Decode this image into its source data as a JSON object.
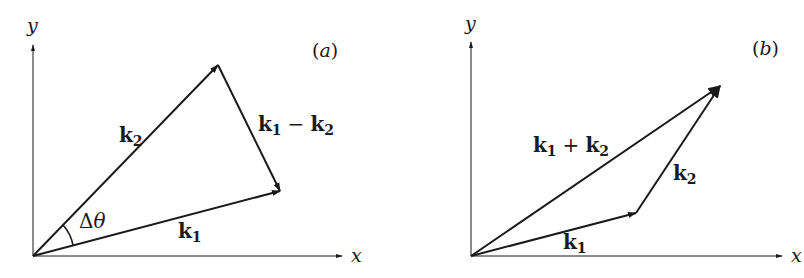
{
  "figure": {
    "panels": [
      {
        "id": "a",
        "tag": "(a)",
        "axes": {
          "x_label": "x",
          "y_label": "y"
        },
        "vectors": [
          {
            "name": "k1",
            "label_base": "k",
            "label_sub": "1",
            "from": "origin",
            "to": "k1-tip"
          },
          {
            "name": "k2",
            "label_base": "k",
            "label_sub": "2",
            "from": "origin",
            "to": "k2-tip"
          },
          {
            "name": "k1-minus-k2",
            "label_a": "k",
            "label_a_sub": "1",
            "op": "−",
            "label_b": "k",
            "label_b_sub": "2",
            "from": "k2-tip",
            "to": "k1-tip"
          }
        ],
        "angle_label": "Δθ"
      },
      {
        "id": "b",
        "tag": "(b)",
        "axes": {
          "x_label": "x",
          "y_label": "y"
        },
        "vectors": [
          {
            "name": "k1",
            "label_base": "k",
            "label_sub": "1",
            "from": "origin",
            "to": "k1-tip"
          },
          {
            "name": "k2",
            "label_base": "k",
            "label_sub": "2",
            "from": "k1-tip",
            "to": "sum-tip"
          },
          {
            "name": "k1-plus-k2",
            "label_a": "k",
            "label_a_sub": "1",
            "op": "+",
            "label_b": "k",
            "label_b_sub": "2",
            "from": "origin",
            "to": "sum-tip"
          }
        ]
      }
    ],
    "colors": {
      "stroke": "#1a1a1a",
      "background": "#ffffff"
    }
  }
}
